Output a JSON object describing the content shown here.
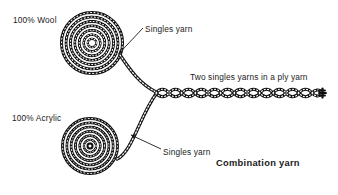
{
  "figure": {
    "title": "Combination yarn",
    "background_color": "#ffffff",
    "ink_color": "#1a1a1a",
    "width": 338,
    "height": 195
  },
  "labels": {
    "wool": "100% Wool",
    "acrylic": "100% Acrylic",
    "singles_top": "Singles yarn",
    "singles_bottom": "Singles yarn",
    "ply": "Two singles yarns in a ply yarn",
    "caption": "Combination yarn"
  },
  "diagram": {
    "coils": [
      {
        "name": "wool-coil",
        "material": "100% Wool",
        "center_x": 92,
        "center_y": 43,
        "outer_radius": 31,
        "turns": 5.2
      },
      {
        "name": "acrylic-coil",
        "material": "100% Acrylic",
        "center_x": 90,
        "center_y": 146,
        "outer_radius": 28,
        "turns": 4.8
      }
    ],
    "strands": [
      {
        "name": "wool-singles-strand",
        "from_coil": "wool-coil",
        "path": "M 119 57 C 131 72 142 84 155 92"
      },
      {
        "name": "acrylic-singles-strand",
        "from_coil": "acrylic-coil",
        "path": "M 116 160 C 130 150 143 112 155 93"
      }
    ],
    "ply": {
      "name": "ply-yarn",
      "start_x": 155,
      "end_x": 325,
      "y": 93,
      "description": "Two singles yarns twisted together into a ply yarn"
    },
    "leaders": [
      {
        "name": "leader-singles-top",
        "x1": 143,
        "y1": 28,
        "x2": 117,
        "y2": 55,
        "arrow_at": "end"
      },
      {
        "name": "leader-singles-bottom",
        "x1": 161,
        "y1": 149,
        "x2": 130,
        "y2": 134,
        "arrow_at": "end"
      }
    ]
  }
}
